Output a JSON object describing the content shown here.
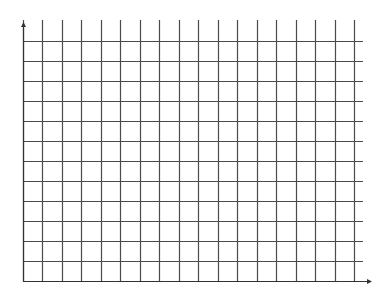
{
  "diagram": {
    "type": "empty-grid",
    "background": "#ffffff",
    "line_color": "#4a4a4a",
    "axis_color": "#333333",
    "origin": {
      "x": 23,
      "y": 281
    },
    "x_axis": {
      "end_x": 372,
      "arrow": true
    },
    "y_axis": {
      "end_y": 22,
      "arrow": true
    },
    "vertical_lines": {
      "count": 18,
      "start_x": 23,
      "spacing": 19.47,
      "top_y": 20,
      "bottom_y": 281
    },
    "horizontal_lines": {
      "count": 13,
      "start_y": 41,
      "spacing": 20,
      "left_x": 23,
      "right_x": 363
    }
  }
}
